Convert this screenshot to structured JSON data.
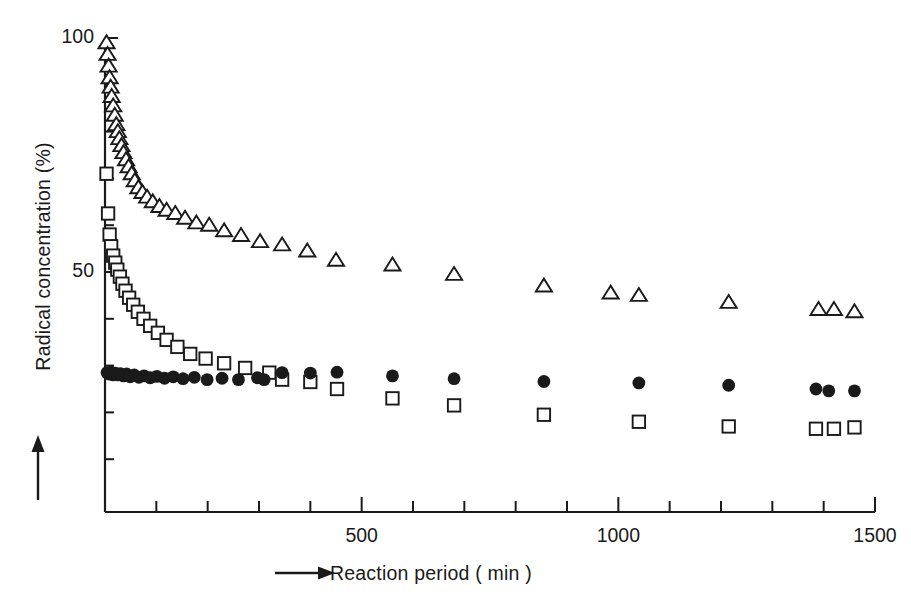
{
  "chart_data": {
    "type": "scatter",
    "title": "",
    "xlabel": "Reaction period ( min )",
    "ylabel": "Radical concentration (%)",
    "xlabel_prefix_icon": "right-arrow-icon",
    "ylabel_prefix_icon": "up-arrow-icon",
    "xlim": [
      0,
      1500
    ],
    "ylim": [
      0,
      108
    ],
    "grid": false,
    "legend": "none",
    "x_major_ticks": [
      500,
      1000,
      1500
    ],
    "x_major_tick_labels": [
      "500",
      "1000",
      "1500"
    ],
    "x_minor_tick_step": 100,
    "y_major_ticks": [
      50,
      100
    ],
    "y_major_tick_labels": [
      "50",
      "100"
    ],
    "y_minor_tick_step": 10,
    "y_minor_tick_min": 10,
    "series": [
      {
        "name": "open-triangle-series",
        "marker": "triangle-up-open",
        "color": "#1a1a1a",
        "points": [
          [
            3,
            99.0
          ],
          [
            5,
            96.5
          ],
          [
            7,
            94.0
          ],
          [
            9,
            91.5
          ],
          [
            11,
            89.5
          ],
          [
            13,
            87.5
          ],
          [
            16,
            85.5
          ],
          [
            19,
            83.5
          ],
          [
            22,
            81.5
          ],
          [
            25,
            80.0
          ],
          [
            28,
            78.5
          ],
          [
            32,
            77.0
          ],
          [
            36,
            75.5
          ],
          [
            41,
            74.0
          ],
          [
            46,
            72.5
          ],
          [
            52,
            71.0
          ],
          [
            58,
            69.5
          ],
          [
            65,
            68.0
          ],
          [
            73,
            67.0
          ],
          [
            82,
            66.0
          ],
          [
            93,
            65.0
          ],
          [
            106,
            64.0
          ],
          [
            120,
            63.2
          ],
          [
            137,
            62.5
          ],
          [
            156,
            61.5
          ],
          [
            178,
            60.5
          ],
          [
            203,
            60.0
          ],
          [
            232,
            58.8
          ],
          [
            265,
            57.8
          ],
          [
            302,
            56.5
          ],
          [
            345,
            55.8
          ],
          [
            394,
            54.5
          ],
          [
            450,
            52.5
          ],
          [
            560,
            51.5
          ],
          [
            680,
            49.5
          ],
          [
            855,
            47.0
          ],
          [
            985,
            45.5
          ],
          [
            1040,
            45.0
          ],
          [
            1215,
            43.5
          ],
          [
            1390,
            42.0
          ],
          [
            1420,
            42.0
          ],
          [
            1460,
            41.5
          ]
        ]
      },
      {
        "name": "open-square-series",
        "marker": "square-open",
        "color": "#1a1a1a",
        "points": [
          [
            3,
            71.0
          ],
          [
            6,
            62.5
          ],
          [
            9,
            58.0
          ],
          [
            12,
            55.5
          ],
          [
            16,
            53.5
          ],
          [
            20,
            52.0
          ],
          [
            24,
            50.5
          ],
          [
            29,
            49.0
          ],
          [
            34,
            47.5
          ],
          [
            40,
            46.0
          ],
          [
            47,
            44.5
          ],
          [
            55,
            43.0
          ],
          [
            64,
            41.5
          ],
          [
            75,
            40.0
          ],
          [
            88,
            38.5
          ],
          [
            103,
            37.0
          ],
          [
            120,
            35.5
          ],
          [
            141,
            34.0
          ],
          [
            166,
            32.5
          ],
          [
            196,
            31.5
          ],
          [
            232,
            30.5
          ],
          [
            273,
            29.5
          ],
          [
            320,
            28.5
          ],
          [
            345,
            27.0
          ],
          [
            400,
            26.5
          ],
          [
            452,
            25.0
          ],
          [
            560,
            23.0
          ],
          [
            680,
            21.5
          ],
          [
            855,
            19.5
          ],
          [
            1040,
            18.0
          ],
          [
            1215,
            17.0
          ],
          [
            1385,
            16.5
          ],
          [
            1420,
            16.5
          ],
          [
            1460,
            16.8
          ]
        ]
      },
      {
        "name": "filled-circle-series",
        "marker": "circle-filled",
        "color": "#1a1a1a",
        "points": [
          [
            4,
            28.5
          ],
          [
            8,
            28.2
          ],
          [
            12,
            28.6
          ],
          [
            16,
            28.0
          ],
          [
            20,
            28.4
          ],
          [
            25,
            28.0
          ],
          [
            30,
            28.3
          ],
          [
            36,
            27.8
          ],
          [
            42,
            28.2
          ],
          [
            49,
            27.6
          ],
          [
            57,
            28.0
          ],
          [
            66,
            27.5
          ],
          [
            76,
            27.8
          ],
          [
            88,
            27.4
          ],
          [
            101,
            27.7
          ],
          [
            116,
            27.3
          ],
          [
            133,
            27.6
          ],
          [
            152,
            27.2
          ],
          [
            174,
            27.5
          ],
          [
            199,
            27.0
          ],
          [
            228,
            27.3
          ],
          [
            260,
            27.0
          ],
          [
            297,
            27.4
          ],
          [
            310,
            27.0
          ],
          [
            345,
            28.5
          ],
          [
            400,
            28.4
          ],
          [
            452,
            28.6
          ],
          [
            560,
            27.8
          ],
          [
            680,
            27.2
          ],
          [
            855,
            26.6
          ],
          [
            1040,
            26.3
          ],
          [
            1215,
            25.8
          ],
          [
            1385,
            25.0
          ],
          [
            1410,
            24.6
          ],
          [
            1460,
            24.6
          ]
        ]
      }
    ]
  }
}
